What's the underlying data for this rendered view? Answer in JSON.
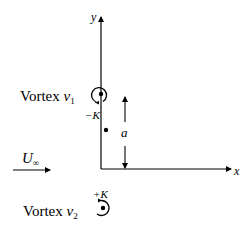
{
  "diagram": {
    "axes": {
      "x_label": "x",
      "y_label": "y"
    },
    "vortex1": {
      "label": "Vortex ",
      "symbol": "v",
      "subscript": "1",
      "strength": "−K",
      "rotation": "clockwise"
    },
    "vortex2": {
      "label": "Vortex ",
      "symbol": "v",
      "subscript": "2",
      "strength": "+K",
      "rotation": "counterclockwise"
    },
    "distance": {
      "label": "a"
    },
    "freestream": {
      "symbol": "U",
      "subscript": "∞"
    },
    "colors": {
      "ink": "#000000",
      "background": "#ffffff"
    }
  }
}
